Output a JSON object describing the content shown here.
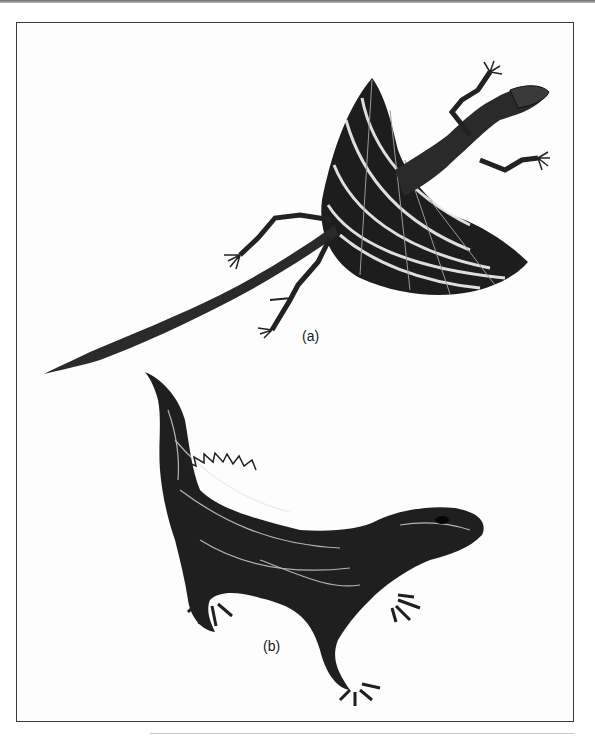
{
  "figure": {
    "panels": [
      {
        "id": "a",
        "label": "(a)",
        "subject": "flying lizard (Draco) with patagium wings extended",
        "icon": "flying-lizard-illustration"
      },
      {
        "id": "b",
        "label": "(b)",
        "subject": "tuatara-like reptile with spiny crest",
        "icon": "tuatara-illustration"
      }
    ]
  },
  "colors": {
    "ink": "#1a1a1a",
    "frame": "#3a3a3a",
    "background": "#ffffff"
  }
}
